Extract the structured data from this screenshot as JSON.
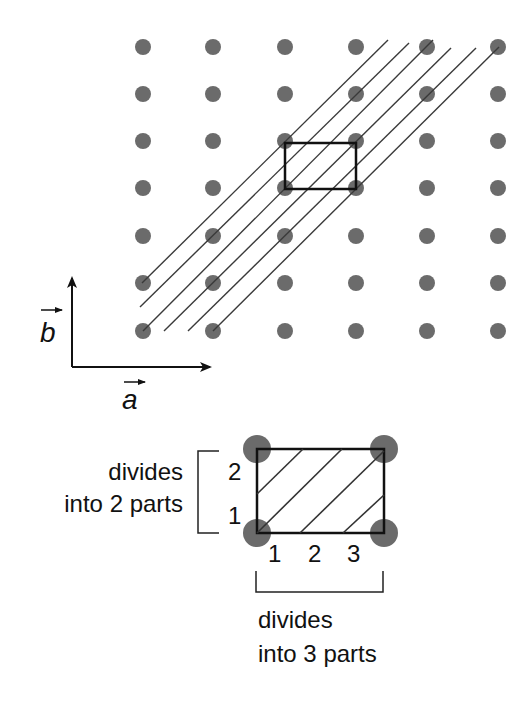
{
  "lattice": {
    "columns_x": [
      143,
      213,
      285,
      356,
      427,
      498
    ],
    "rows_y": [
      47,
      94,
      141,
      188,
      236,
      283,
      331
    ],
    "dot_radius": 8,
    "dot_color": "#6b6b6b"
  },
  "lattice_planes": {
    "color": "#3a3a3a",
    "lines": [
      {
        "x1": 142,
        "y1": 283,
        "x2": 388,
        "y2": 40
      },
      {
        "x1": 140,
        "y1": 307,
        "x2": 409,
        "y2": 43
      },
      {
        "x1": 143,
        "y1": 331,
        "x2": 433,
        "y2": 40
      },
      {
        "x1": 164,
        "y1": 331,
        "x2": 451,
        "y2": 48
      },
      {
        "x1": 188,
        "y1": 331,
        "x2": 476,
        "y2": 48
      },
      {
        "x1": 213,
        "y1": 331,
        "x2": 499,
        "y2": 47
      }
    ]
  },
  "unit_cell_highlight": {
    "x": 285,
    "y": 143,
    "width": 71,
    "height": 46
  },
  "axes": {
    "origin": {
      "x": 72,
      "y": 367
    },
    "b_label": "b",
    "a_label": "a"
  },
  "detail": {
    "rect": {
      "x": 257,
      "y": 449,
      "width": 127,
      "height": 84
    },
    "corner_radius": 14,
    "hatch_lines": [
      {
        "x1": 257,
        "y1": 494,
        "x2": 303,
        "y2": 449
      },
      {
        "x1": 257,
        "y1": 533,
        "x2": 342,
        "y2": 449
      },
      {
        "x1": 300,
        "y1": 533,
        "x2": 384,
        "y2": 451
      },
      {
        "x1": 343,
        "y1": 533,
        "x2": 384,
        "y2": 495
      }
    ],
    "vertical_ticks": [
      "2",
      "1"
    ],
    "horizontal_ticks": [
      "1",
      "2",
      "3"
    ],
    "left_label_line1": "divides",
    "left_label_line2": "into 2 parts",
    "bottom_label_line1": "divides",
    "bottom_label_line2": "into 3 parts"
  }
}
